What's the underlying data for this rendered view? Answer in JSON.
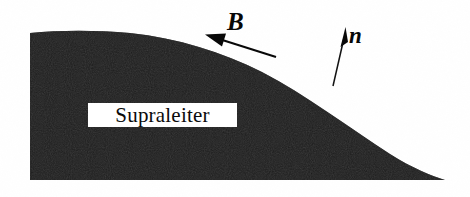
{
  "figure": {
    "width": 470,
    "height": 197,
    "background_color": "#ffffff"
  },
  "body": {
    "name": "superconductor-body",
    "label": "Supraleiter",
    "fill_color": "#0a0a0a",
    "description": "Dunkel gefuellter Koerper mit flacher Unterkante, senkrechter linker Kante und konvex nach rechts abfallender Oberkante, die in einer Spitze endet.",
    "geometry": {
      "left_edge_x": 30,
      "top_edge_y": 31,
      "bottom_edge_y": 180,
      "tip_x": 445,
      "tip_y": 180
    }
  },
  "vectors": [
    {
      "name": "magnetic-field-vector",
      "label": "B",
      "style": "bold-italic-serif",
      "color": "#070707",
      "orientation": "tangential",
      "points_to": "upper-left",
      "tail": {
        "x": 276,
        "y": 57
      },
      "head": {
        "x": 207,
        "y": 35
      },
      "label_position": {
        "x": 227,
        "y": 9
      }
    },
    {
      "name": "surface-normal-vector",
      "label": "n",
      "style": "bold-italic-serif",
      "color": "#070707",
      "orientation": "normal",
      "points_to": "upper-left",
      "tail": {
        "x": 333,
        "y": 86
      },
      "head": {
        "x": 345,
        "y": 29
      },
      "label_position": {
        "x": 349,
        "y": 24
      }
    }
  ],
  "annotations": {
    "superconductor_box": {
      "name": "superconductor-label-box",
      "text": "Supraleiter",
      "background_color": "#ffffff",
      "text_color": "#0b0b0b",
      "x": 88,
      "y": 103,
      "width": 149,
      "height": 24
    }
  }
}
